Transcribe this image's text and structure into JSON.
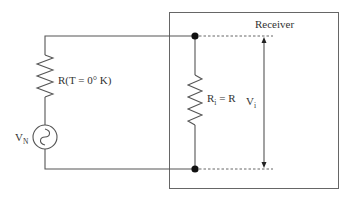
{
  "diagram": {
    "type": "circuit",
    "receiver": {
      "label": "Receiver"
    },
    "source_resistor": {
      "label": "R(T = 0° K)"
    },
    "noise_source": {
      "label_main": "V",
      "label_sub": "N"
    },
    "input_resistor": {
      "label_main": "R",
      "label_sub": "i",
      "label_rest": " = R"
    },
    "input_voltage": {
      "label_main": "V",
      "label_sub": "i"
    },
    "colors": {
      "wire": "#555555",
      "box": "#666666",
      "dot": "#111111",
      "text": "#333333"
    }
  }
}
